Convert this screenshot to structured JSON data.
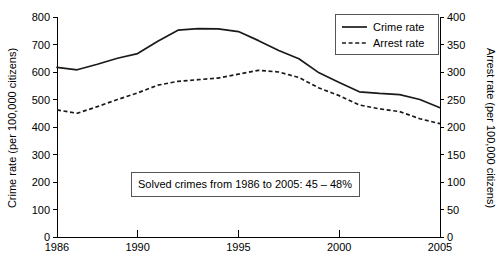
{
  "chart_data": {
    "type": "line",
    "title": "",
    "xlabel": "",
    "ylabel": "Crime rate (per 100,000 citizens)",
    "y2label": "Arrest rate (per 100,000 citizens)",
    "grid": false,
    "legend_position": "top-right",
    "xlim": [
      1986,
      2005
    ],
    "ylim": [
      0,
      800
    ],
    "y2lim": [
      0,
      400
    ],
    "xticks": [
      1986,
      1990,
      1995,
      2000,
      2005
    ],
    "xtick_labels": [
      "1986",
      "1990",
      "1995",
      "2000",
      "2005"
    ],
    "yticks": [
      0,
      100,
      200,
      300,
      400,
      500,
      600,
      700,
      800
    ],
    "ytick_labels": [
      "0",
      "100",
      "200",
      "300",
      "400",
      "500",
      "600",
      "700",
      "800"
    ],
    "y2ticks": [
      0,
      50,
      100,
      150,
      200,
      250,
      300,
      350,
      400
    ],
    "y2tick_labels": [
      "0",
      "50",
      "100",
      "150",
      "200",
      "250",
      "300",
      "350",
      "400"
    ],
    "x": [
      1986,
      1987,
      1988,
      1989,
      1990,
      1991,
      1992,
      1993,
      1994,
      1995,
      1996,
      1997,
      1998,
      1999,
      2000,
      2001,
      2002,
      2003,
      2004,
      2005
    ],
    "series": [
      {
        "name": "Crime rate",
        "axis": "left",
        "style": "solid",
        "values": [
          617,
          608,
          628,
          650,
          667,
          712,
          752,
          758,
          757,
          747,
          714,
          678,
          648,
          597,
          562,
          528,
          522,
          518,
          500,
          470
        ]
      },
      {
        "name": "Arrest rate",
        "axis": "right",
        "style": "dashed",
        "values": [
          231,
          225,
          237,
          250,
          262,
          276,
          283,
          286,
          289,
          296,
          303,
          300,
          290,
          271,
          257,
          240,
          233,
          228,
          215,
          206
        ]
      }
    ],
    "annotations": [
      {
        "text": "Solved crimes from 1986 to 2005: 45 – 48%",
        "boxed": true
      }
    ]
  },
  "legend": {
    "items": [
      {
        "label": "Crime rate",
        "style": "solid"
      },
      {
        "label": "Arrest rate",
        "style": "dashed"
      }
    ]
  }
}
